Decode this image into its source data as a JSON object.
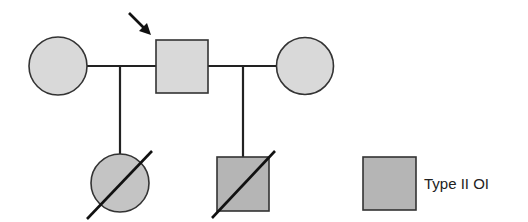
{
  "diagram": {
    "type": "pedigree",
    "colors": {
      "stroke": "#222222",
      "affected_light_fill": "#d9d9d9",
      "affected_dark_fill": "#b5b5b5"
    },
    "individuals": [
      {
        "id": "I-1",
        "sex": "female",
        "status": "affected-light",
        "position": "generation-1-left"
      },
      {
        "id": "I-2",
        "sex": "male",
        "status": "affected-light",
        "proband": true,
        "position": "generation-1-center"
      },
      {
        "id": "I-3",
        "sex": "female",
        "status": "affected-light",
        "position": "generation-1-right"
      },
      {
        "id": "II-1",
        "sex": "female",
        "status": "affected-deceased",
        "position": "generation-2-left"
      },
      {
        "id": "II-2",
        "sex": "male",
        "status": "affected-deceased",
        "position": "generation-2-right"
      }
    ],
    "matings": [
      {
        "partners": [
          "I-1",
          "I-2"
        ],
        "children": [
          "II-1"
        ]
      },
      {
        "partners": [
          "I-2",
          "I-3"
        ],
        "children": [
          "II-2"
        ]
      }
    ],
    "proband_marker": "arrow"
  },
  "legend": {
    "items": [
      {
        "symbol": "square-shaded",
        "label": "Type II OI"
      }
    ]
  }
}
